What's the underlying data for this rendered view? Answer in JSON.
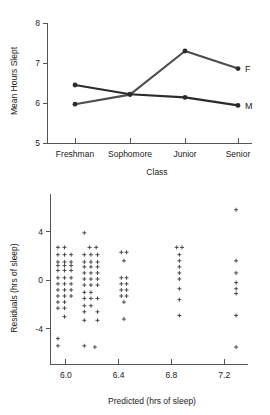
{
  "chart_data": [
    {
      "type": "line",
      "title": "",
      "xlabel": "Class",
      "ylabel": "Mean Hours Slept",
      "categories": [
        "Freshman",
        "Sophomore",
        "Junior",
        "Senior"
      ],
      "ytick_labels": [
        "5",
        "6",
        "7",
        "8"
      ],
      "yticks": [
        5,
        6,
        7,
        8
      ],
      "ylim": [
        5,
        8
      ],
      "grid": false,
      "legend_position": "right-inline",
      "series": [
        {
          "name": "F",
          "label": "F",
          "values": [
            5.97,
            6.21,
            7.3,
            6.86
          ],
          "color": "#4d4d4d"
        },
        {
          "name": "M",
          "label": "M",
          "values": [
            6.45,
            6.22,
            6.14,
            5.94
          ],
          "color": "#2b2b2b"
        }
      ]
    },
    {
      "type": "scatter",
      "title": "",
      "xlabel": "Predicted (hrs of sleep)",
      "ylabel": "Residuals (hrs of sleep)",
      "xtick_labels": [
        "6.0",
        "6.4",
        "6.8",
        "7.2"
      ],
      "xticks": [
        6.0,
        6.4,
        6.8,
        7.2
      ],
      "ytick_labels": [
        "-4",
        "0",
        "4"
      ],
      "yticks": [
        -4,
        0,
        4
      ],
      "xlim": [
        5.88,
        7.38
      ],
      "ylim": [
        -6.4,
        6.6
      ],
      "grid": false,
      "marker": "plus",
      "points": [
        {
          "x": 5.94,
          "y": 2.7
        },
        {
          "x": 5.99,
          "y": 2.7
        },
        {
          "x": 5.94,
          "y": 2.1
        },
        {
          "x": 5.99,
          "y": 2.1
        },
        {
          "x": 6.04,
          "y": 2.1
        },
        {
          "x": 5.94,
          "y": 1.5
        },
        {
          "x": 5.99,
          "y": 1.5
        },
        {
          "x": 6.04,
          "y": 1.5
        },
        {
          "x": 5.94,
          "y": 1.2
        },
        {
          "x": 5.99,
          "y": 1.2
        },
        {
          "x": 6.04,
          "y": 1.2
        },
        {
          "x": 5.94,
          "y": 0.8
        },
        {
          "x": 5.99,
          "y": 0.8
        },
        {
          "x": 6.04,
          "y": 0.8
        },
        {
          "x": 5.94,
          "y": 0.2
        },
        {
          "x": 5.99,
          "y": 0.2
        },
        {
          "x": 6.04,
          "y": 0.2
        },
        {
          "x": 5.94,
          "y": -0.3
        },
        {
          "x": 5.99,
          "y": -0.3
        },
        {
          "x": 6.04,
          "y": -0.3
        },
        {
          "x": 5.94,
          "y": -0.8
        },
        {
          "x": 5.99,
          "y": -0.8
        },
        {
          "x": 6.04,
          "y": -0.8
        },
        {
          "x": 5.94,
          "y": -1.3
        },
        {
          "x": 5.99,
          "y": -1.3
        },
        {
          "x": 6.04,
          "y": -1.3
        },
        {
          "x": 5.94,
          "y": -1.8
        },
        {
          "x": 5.99,
          "y": -1.8
        },
        {
          "x": 5.94,
          "y": -2.3
        },
        {
          "x": 5.99,
          "y": -2.3
        },
        {
          "x": 5.99,
          "y": -3.0
        },
        {
          "x": 5.94,
          "y": -4.8
        },
        {
          "x": 5.94,
          "y": -5.4
        },
        {
          "x": 6.14,
          "y": 3.9
        },
        {
          "x": 6.18,
          "y": 2.7
        },
        {
          "x": 6.23,
          "y": 2.7
        },
        {
          "x": 6.14,
          "y": 2.1
        },
        {
          "x": 6.19,
          "y": 2.1
        },
        {
          "x": 6.24,
          "y": 2.1
        },
        {
          "x": 6.14,
          "y": 1.5
        },
        {
          "x": 6.19,
          "y": 1.5
        },
        {
          "x": 6.24,
          "y": 1.5
        },
        {
          "x": 6.14,
          "y": 1.1
        },
        {
          "x": 6.19,
          "y": 1.1
        },
        {
          "x": 6.24,
          "y": 1.1
        },
        {
          "x": 6.14,
          "y": 0.6
        },
        {
          "x": 6.19,
          "y": 0.6
        },
        {
          "x": 6.24,
          "y": 0.6
        },
        {
          "x": 6.14,
          "y": 0.1
        },
        {
          "x": 6.19,
          "y": 0.1
        },
        {
          "x": 6.24,
          "y": 0.1
        },
        {
          "x": 6.14,
          "y": -0.4
        },
        {
          "x": 6.19,
          "y": -0.4
        },
        {
          "x": 6.24,
          "y": -0.4
        },
        {
          "x": 6.14,
          "y": -1.0
        },
        {
          "x": 6.19,
          "y": -1.0
        },
        {
          "x": 6.14,
          "y": -1.5
        },
        {
          "x": 6.19,
          "y": -1.5
        },
        {
          "x": 6.24,
          "y": -1.5
        },
        {
          "x": 6.14,
          "y": -2.1
        },
        {
          "x": 6.19,
          "y": -2.1
        },
        {
          "x": 6.14,
          "y": -2.6
        },
        {
          "x": 6.24,
          "y": -2.6
        },
        {
          "x": 6.14,
          "y": -3.3
        },
        {
          "x": 6.24,
          "y": -3.3
        },
        {
          "x": 6.14,
          "y": -5.4
        },
        {
          "x": 6.22,
          "y": -5.5
        },
        {
          "x": 6.42,
          "y": 2.3
        },
        {
          "x": 6.46,
          "y": 2.3
        },
        {
          "x": 6.44,
          "y": 1.6
        },
        {
          "x": 6.42,
          "y": 0.2
        },
        {
          "x": 6.46,
          "y": 0.2
        },
        {
          "x": 6.42,
          "y": -0.3
        },
        {
          "x": 6.46,
          "y": -0.3
        },
        {
          "x": 6.42,
          "y": -0.8
        },
        {
          "x": 6.46,
          "y": -0.8
        },
        {
          "x": 6.42,
          "y": -1.3
        },
        {
          "x": 6.46,
          "y": -1.3
        },
        {
          "x": 6.44,
          "y": -1.8
        },
        {
          "x": 6.44,
          "y": -3.2
        },
        {
          "x": 6.84,
          "y": 2.7
        },
        {
          "x": 6.88,
          "y": 2.7
        },
        {
          "x": 6.86,
          "y": 2.1
        },
        {
          "x": 6.86,
          "y": 1.6
        },
        {
          "x": 6.86,
          "y": 1.1
        },
        {
          "x": 6.86,
          "y": 0.6
        },
        {
          "x": 6.86,
          "y": 0.1
        },
        {
          "x": 6.86,
          "y": -0.7
        },
        {
          "x": 6.86,
          "y": -1.6
        },
        {
          "x": 6.86,
          "y": -2.9
        },
        {
          "x": 7.29,
          "y": 5.8
        },
        {
          "x": 7.29,
          "y": 1.6
        },
        {
          "x": 7.29,
          "y": 0.6
        },
        {
          "x": 7.29,
          "y": -0.2
        },
        {
          "x": 7.29,
          "y": -0.7
        },
        {
          "x": 7.29,
          "y": -1.1
        },
        {
          "x": 7.29,
          "y": -2.9
        },
        {
          "x": 7.29,
          "y": -5.5
        }
      ]
    }
  ]
}
